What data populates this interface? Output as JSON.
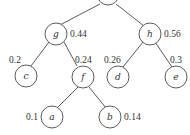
{
  "diagram": {
    "type": "huffman-tree",
    "nodes": {
      "root": {
        "label": "",
        "weight": "1"
      },
      "g": {
        "label": "g",
        "weight": "0.44"
      },
      "h": {
        "label": "h",
        "weight": "0.56"
      },
      "c": {
        "label": "c",
        "weight": "0.2"
      },
      "f": {
        "label": "f",
        "weight": "0.24"
      },
      "d": {
        "label": "d",
        "weight": "0.26"
      },
      "e": {
        "label": "e",
        "weight": "0.3"
      },
      "a": {
        "label": "a",
        "weight": "0.1"
      },
      "b": {
        "label": "b",
        "weight": "0.14"
      }
    },
    "edges": [
      [
        "root",
        "g"
      ],
      [
        "root",
        "h"
      ],
      [
        "g",
        "c"
      ],
      [
        "g",
        "f"
      ],
      [
        "h",
        "d"
      ],
      [
        "h",
        "e"
      ],
      [
        "f",
        "a"
      ],
      [
        "f",
        "b"
      ]
    ]
  }
}
